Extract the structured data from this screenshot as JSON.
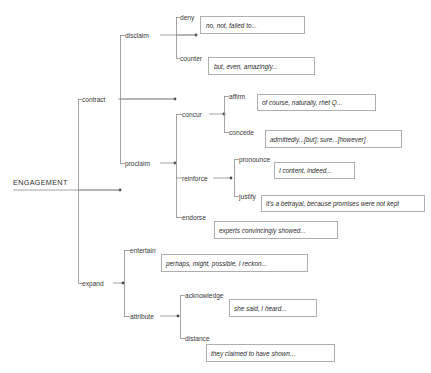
{
  "diagram": {
    "title": "ENGAGEMENT",
    "type": "tree",
    "root": {
      "label": "ENGAGEMENT",
      "x": 13,
      "y": 182,
      "anchor_x": 73,
      "anchor_y": 188
    },
    "nodes": [
      {
        "id": "contract",
        "label": "contract",
        "level": 1,
        "x": 82,
        "y": 99,
        "dot_x": 120,
        "dot_y": 99
      },
      {
        "id": "disclaim",
        "label": "disclaim",
        "level": 2,
        "x": 125,
        "y": 35,
        "dot_x": 175,
        "dot_y": 35
      },
      {
        "id": "deny",
        "label": "deny",
        "level": 3,
        "x": 180,
        "y": 17,
        "dot_x": 196,
        "dot_y": 17
      },
      {
        "id": "counter",
        "label": "counter",
        "level": 3,
        "x": 180,
        "y": 58,
        "dot_x": 205,
        "dot_y": 58
      },
      {
        "id": "proclaim",
        "label": "proclaim",
        "level": 2,
        "x": 125,
        "y": 163,
        "dot_x": 175,
        "dot_y": 163
      },
      {
        "id": "concur",
        "label": "concur",
        "level": 3,
        "x": 182,
        "y": 114,
        "dot_x": 224,
        "dot_y": 114
      },
      {
        "id": "affirm",
        "label": "affirm",
        "level": 4,
        "x": 229,
        "y": 96,
        "dot_x": 254,
        "dot_y": 96
      },
      {
        "id": "concede",
        "label": "concede",
        "level": 4,
        "x": 229,
        "y": 132,
        "dot_x": 262,
        "dot_y": 132
      },
      {
        "id": "reinforce",
        "label": "reinforce",
        "level": 3,
        "x": 182,
        "y": 178,
        "dot_x": 231,
        "dot_y": 178
      },
      {
        "id": "pronounce",
        "label": "pronounce",
        "level": 4,
        "x": 239,
        "y": 159,
        "dot_x": 271,
        "dot_y": 159
      },
      {
        "id": "justify",
        "label": "justify",
        "level": 4,
        "x": 239,
        "y": 196,
        "dot_x": 258,
        "dot_y": 196
      },
      {
        "id": "endorse",
        "label": "endorse",
        "level": 3,
        "x": 182,
        "y": 217,
        "dot_x": 207,
        "dot_y": 217
      },
      {
        "id": "expand",
        "label": "expand",
        "level": 1,
        "x": 82,
        "y": 283,
        "dot_x": 123,
        "dot_y": 283
      },
      {
        "id": "entertain",
        "label": "entertain",
        "level": 2,
        "x": 130,
        "y": 250,
        "dot_x": 158,
        "dot_y": 250
      },
      {
        "id": "attribute",
        "label": "attribute",
        "level": 2,
        "x": 130,
        "y": 316,
        "dot_x": 178,
        "dot_y": 316
      },
      {
        "id": "acknowledge",
        "label": "acknowledge",
        "level": 3,
        "x": 185,
        "y": 295,
        "dot_x": 227,
        "dot_y": 295
      },
      {
        "id": "distance",
        "label": "distance",
        "level": 3,
        "x": 185,
        "y": 338,
        "dot_x": 211,
        "dot_y": 338
      }
    ],
    "examples": [
      {
        "id": "ex-deny",
        "parent": "deny",
        "text": "no, not, failed to...",
        "x": 200,
        "y": 16,
        "w": 104,
        "h": 17
      },
      {
        "id": "ex-counter",
        "parent": "counter",
        "text": "but, even, amazingly...",
        "x": 208,
        "y": 57,
        "w": 106,
        "h": 17
      },
      {
        "id": "ex-affirm",
        "parent": "affirm",
        "text": "of course, naturally, rhet Q...",
        "x": 257,
        "y": 94,
        "w": 118,
        "h": 16
      },
      {
        "id": "ex-concede",
        "parent": "concede",
        "text": "admittedly...[but]; sure...[however]",
        "x": 265,
        "y": 130,
        "w": 136,
        "h": 17
      },
      {
        "id": "ex-pronounce",
        "parent": "pronounce",
        "text": "I content, indeed...",
        "x": 274,
        "y": 162,
        "w": 80,
        "h": 16
      },
      {
        "id": "ex-justify",
        "parent": "justify",
        "text": "it's a betrayal, because promises were not kept",
        "x": 261,
        "y": 195,
        "w": 163,
        "h": 16
      },
      {
        "id": "ex-endorse",
        "parent": "endorse",
        "text": "experts convincingly showed...",
        "x": 214,
        "y": 221,
        "w": 123,
        "h": 17
      },
      {
        "id": "ex-entertain",
        "parent": "entertain",
        "text": "perhaps, might, possible, I reckon...",
        "x": 161,
        "y": 254,
        "w": 146,
        "h": 17
      },
      {
        "id": "ex-acknowledge",
        "parent": "acknowledge",
        "text": "she said, I heard...",
        "x": 229,
        "y": 299,
        "w": 87,
        "h": 17
      },
      {
        "id": "ex-distance",
        "parent": "distance",
        "text": "they claimed to have shown...",
        "x": 206,
        "y": 344,
        "w": 128,
        "h": 17
      }
    ],
    "colors": {
      "line": "#8d8d8d",
      "box_border": "#9a9a9a",
      "text": "#2b2b2b",
      "label": "#3a3a3a",
      "background": "#ffffff"
    }
  }
}
